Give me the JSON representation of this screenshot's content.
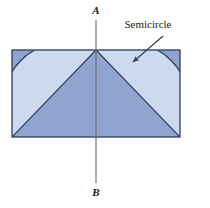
{
  "figure": {
    "background_color": "#ffffff",
    "labels": {
      "axis_top": "A",
      "axis_bottom": "B",
      "callout": "Semicircle"
    },
    "colors": {
      "fill_dark": "#90a4d0",
      "fill_light": "#ccdaf0",
      "stroke": "#2f3a5c",
      "axis_line": "#6b6b6b",
      "callout_line": "#2f3a5c",
      "text": "#1a1a1a"
    },
    "geometry": {
      "rect": {
        "x": 12,
        "y": 50,
        "width": 168,
        "height": 87
      },
      "apex": {
        "x": 96,
        "y": 50
      },
      "bottom_left": {
        "x": 12,
        "y": 137
      },
      "bottom_right": {
        "x": 180,
        "y": 137
      },
      "semicircle_radius": 61,
      "axis": {
        "x": 96,
        "y_top": 20,
        "y_bottom": 183
      },
      "callout_arrow": {
        "from_x": 163,
        "from_y": 36,
        "to_x": 133,
        "to_y": 62
      },
      "label_positions": {
        "axis_top": {
          "x": 96,
          "y": 14
        },
        "axis_bottom": {
          "x": 96,
          "y": 196
        },
        "callout": {
          "x": 148,
          "y": 28
        }
      }
    }
  }
}
